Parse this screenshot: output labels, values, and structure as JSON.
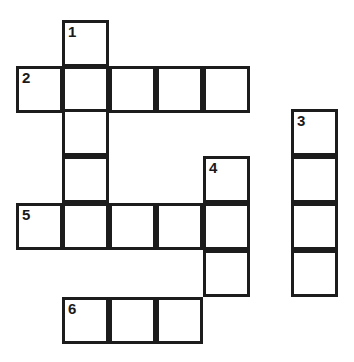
{
  "puzzle": {
    "type": "crossword-grid",
    "title": "",
    "background_color": "#ffffff",
    "line_color": "#1c1c1c",
    "cell_size": 47,
    "line_width": 3,
    "number_color": "#1a1a1a",
    "numbered_clues": [
      "1",
      "2",
      "3",
      "4",
      "5",
      "6"
    ],
    "entries": [
      {
        "number": "1",
        "direction": "down",
        "length": 4,
        "start_col": 1,
        "start_row": 0
      },
      {
        "number": "2",
        "direction": "across",
        "length": 5,
        "start_col": 0,
        "start_row": 1
      },
      {
        "number": "3",
        "direction": "down",
        "length": 4,
        "start_col": 6,
        "start_row": 2
      },
      {
        "number": "4",
        "direction": "down",
        "length": 4,
        "start_col": 4,
        "start_row": 3
      },
      {
        "number": "5",
        "direction": "across",
        "length": 5,
        "start_col": 0,
        "start_row": 4
      },
      {
        "number": "6",
        "direction": "across",
        "length": 3,
        "start_col": 1,
        "start_row": 6
      }
    ],
    "cells": [
      {
        "id": "c-r0-c1",
        "x": 62,
        "y": 20,
        "number": "1",
        "letter": ""
      },
      {
        "id": "c-r1-c0",
        "x": 16,
        "y": 66,
        "number": "2",
        "letter": ""
      },
      {
        "id": "c-r1-c1",
        "x": 62,
        "y": 66,
        "number": "",
        "letter": ""
      },
      {
        "id": "c-r1-c2",
        "x": 109,
        "y": 66,
        "number": "",
        "letter": ""
      },
      {
        "id": "c-r1-c3",
        "x": 156,
        "y": 66,
        "number": "",
        "letter": ""
      },
      {
        "id": "c-r1-c4",
        "x": 203,
        "y": 66,
        "number": "",
        "letter": ""
      },
      {
        "id": "c-r2-c1",
        "x": 62,
        "y": 109,
        "number": "",
        "letter": ""
      },
      {
        "id": "c-r2-c6",
        "x": 291,
        "y": 109,
        "number": "3",
        "letter": ""
      },
      {
        "id": "c-r3-c1",
        "x": 62,
        "y": 156,
        "number": "",
        "letter": ""
      },
      {
        "id": "c-r3-c4",
        "x": 203,
        "y": 156,
        "number": "4",
        "letter": ""
      },
      {
        "id": "c-r3-c6",
        "x": 291,
        "y": 156,
        "number": "",
        "letter": ""
      },
      {
        "id": "c-r4-c0",
        "x": 16,
        "y": 203,
        "number": "5",
        "letter": ""
      },
      {
        "id": "c-r4-c1",
        "x": 62,
        "y": 203,
        "number": "",
        "letter": ""
      },
      {
        "id": "c-r4-c2",
        "x": 109,
        "y": 203,
        "number": "",
        "letter": ""
      },
      {
        "id": "c-r4-c3",
        "x": 156,
        "y": 203,
        "number": "",
        "letter": ""
      },
      {
        "id": "c-r4-c4",
        "x": 203,
        "y": 203,
        "number": "",
        "letter": ""
      },
      {
        "id": "c-r4-c6",
        "x": 291,
        "y": 203,
        "number": "",
        "letter": ""
      },
      {
        "id": "c-r5-c4",
        "x": 203,
        "y": 250,
        "number": "",
        "letter": ""
      },
      {
        "id": "c-r5-c6",
        "x": 291,
        "y": 250,
        "number": "",
        "letter": ""
      },
      {
        "id": "c-r6-c1",
        "x": 62,
        "y": 297,
        "number": "6",
        "letter": ""
      },
      {
        "id": "c-r6-c2",
        "x": 109,
        "y": 297,
        "number": "",
        "letter": ""
      },
      {
        "id": "c-r6-c3",
        "x": 156,
        "y": 297,
        "number": "",
        "letter": ""
      }
    ]
  }
}
